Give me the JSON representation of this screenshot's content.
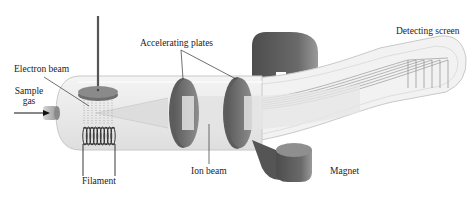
{
  "diagram": {
    "labels": {
      "electron_beam": "Electron beam",
      "sample_gas_line1": "Sample",
      "sample_gas_line2": "gas",
      "accelerating_plates": "Accelerating plates",
      "detecting_screen": "Detecting screen",
      "filament": "Filament",
      "ion_beam": "Ion beam",
      "magnet": "Magnet"
    },
    "components": [
      "sample-gas-inlet",
      "electron-plate",
      "filament-coil",
      "electron-beam",
      "accelerating-plate-1",
      "accelerating-plate-2",
      "ion-beam",
      "magnet",
      "detecting-screen",
      "glass-tube"
    ],
    "colors": {
      "tube_fill": "#ececec",
      "tube_outline": "#c8c8c8",
      "plate_dark": "#6b6b6b",
      "plate_face": "#8a8a8a",
      "magnet": "#5e5e5e",
      "magnet_highlight": "#8c8c8c",
      "beam": "#dcdcdc",
      "label_text": "#222222",
      "leader_line": "#333333"
    }
  }
}
